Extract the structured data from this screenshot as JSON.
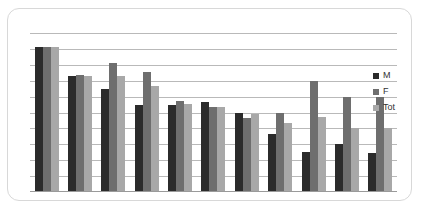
{
  "chart_data": {
    "type": "bar",
    "title": "",
    "subtitle": "",
    "xlabel": "",
    "ylabel": "",
    "categories": [
      "1",
      "2",
      "3",
      "4",
      "5",
      "6",
      "7",
      "8",
      "9",
      "10",
      "11"
    ],
    "series": [
      {
        "name": "M",
        "color": "#2b2b2b",
        "values": [
          100,
          80,
          71,
          60,
          60,
          62,
          55,
          40,
          28,
          33,
          27
        ]
      },
      {
        "name": "F",
        "color": "#6e6e6e",
        "values": [
          100,
          81,
          89,
          83,
          63,
          59,
          51,
          55,
          77,
          66,
          66
        ]
      },
      {
        "name": "Tot",
        "color": "#a8a8a8",
        "values": [
          100,
          80,
          80,
          73,
          61,
          59,
          54,
          48,
          52,
          44,
          44
        ]
      }
    ],
    "ylim": [
      0,
      110
    ],
    "gridlines": 10,
    "grid": true,
    "legend_position": "right",
    "legend_entries": [
      "M",
      "F",
      "Tot"
    ],
    "tick_labels": [],
    "annotations": []
  },
  "legend": {
    "items": [
      {
        "label": "M",
        "swatch": "legend-swatch-m"
      },
      {
        "label": "F",
        "swatch": "legend-swatch-f"
      },
      {
        "label": "Tot",
        "swatch": "legend-swatch-tot"
      }
    ]
  }
}
